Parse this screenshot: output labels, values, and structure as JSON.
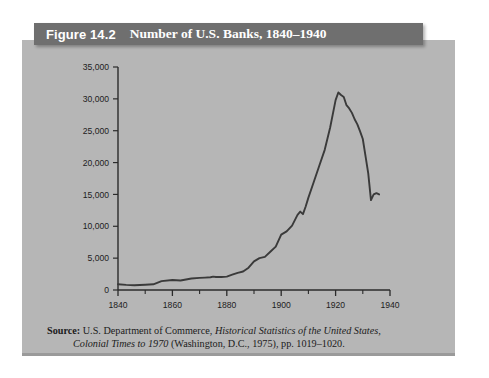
{
  "figure": {
    "number_label": "Figure 14.2",
    "title": "Number of U.S. Banks, 1840–1940"
  },
  "source": {
    "label": "Source:",
    "line1_part1": " U.S. Department of Commerce, ",
    "line1_italic": "Historical Statistics of the United States,",
    "line2_italic": "Colonial Times to 1970",
    "line2_part2": " (Washington, D.C., 1975), pp. 1019–1020."
  },
  "colors": {
    "page_background": "#ffffff",
    "panel_background": "#b6b6b6",
    "title_bar": "#6f6f6f",
    "title_text": "#ffffff",
    "line": "#3a3a3a",
    "axis": "#2b2b2b"
  },
  "chart_data": {
    "type": "line",
    "title": "Number of U.S. Banks, 1840–1940",
    "xlabel": "",
    "ylabel": "",
    "xlim": [
      1840,
      1940
    ],
    "ylim": [
      0,
      35000
    ],
    "grid": false,
    "legend": null,
    "x_ticks_major": [
      1840,
      1860,
      1880,
      1900,
      1920,
      1940
    ],
    "x_tick_labels": [
      "1840",
      "1860",
      "1880",
      "1900",
      "1920",
      "1940"
    ],
    "x_ticks_minor": [
      1850,
      1870,
      1890,
      1910,
      1930
    ],
    "y_ticks": [
      0,
      5000,
      10000,
      15000,
      20000,
      25000,
      30000,
      35000
    ],
    "y_tick_labels": [
      "0",
      "5,000",
      "10,000",
      "15,000",
      "20,000",
      "25,000",
      "30,000",
      "35,000"
    ],
    "series": [
      {
        "name": "Number of U.S. Banks",
        "x": [
          1840,
          1843,
          1846,
          1850,
          1853,
          1856,
          1860,
          1863,
          1865,
          1867,
          1870,
          1872,
          1874,
          1875,
          1876,
          1878,
          1880,
          1882,
          1884,
          1886,
          1888,
          1890,
          1892,
          1894,
          1896,
          1898,
          1900,
          1902,
          1904,
          1906,
          1907,
          1908,
          1909,
          1910,
          1912,
          1914,
          1916,
          1918,
          1920,
          1921,
          1922,
          1923,
          1924,
          1925,
          1926,
          1927,
          1928,
          1929,
          1930,
          1931,
          1932,
          1933,
          1934,
          1935,
          1936
        ],
        "y": [
          900,
          800,
          750,
          820,
          900,
          1400,
          1560,
          1500,
          1650,
          1800,
          1900,
          1950,
          2000,
          2100,
          2050,
          2050,
          2100,
          2400,
          2700,
          2900,
          3500,
          4500,
          5000,
          5200,
          6000,
          6800,
          8700,
          9200,
          10100,
          11800,
          12300,
          11900,
          13100,
          14500,
          17000,
          19500,
          22000,
          25500,
          29800,
          31000,
          30600,
          30300,
          29000,
          28500,
          27800,
          26800,
          26000,
          24900,
          23700,
          21000,
          18300,
          14100,
          15000,
          15200,
          15000
        ]
      }
    ],
    "annotations": {
      "peak_value": 31000,
      "peak_year": 1921,
      "trough_value": 14100,
      "trough_year": 1933,
      "end_value": 15000,
      "end_year": 1936
    }
  }
}
